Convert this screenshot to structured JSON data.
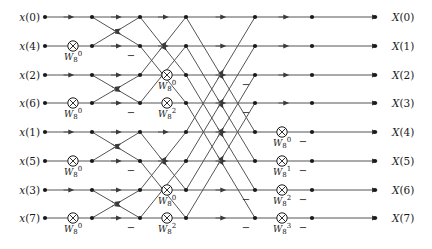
{
  "figure": {
    "kind": "fft-butterfly-signal-flow-graph",
    "size": 8,
    "stages": 3
  },
  "geometry": {
    "width": 432,
    "height": 249,
    "row_y": [
      17,
      46,
      75,
      103,
      132,
      161,
      190,
      218
    ],
    "node_x": [
      45,
      73,
      92,
      140,
      167,
      186,
      255,
      282,
      312,
      375
    ],
    "input_label_x": 40,
    "output_label_x": 392,
    "dot_radius": 2.1,
    "circle_radius": 5.2
  },
  "colors": {
    "line": "#555555",
    "ink": "#1a1a1a",
    "background": "#ffffff"
  },
  "inputs": [
    {
      "label_var": "x",
      "index": "0"
    },
    {
      "label_var": "x",
      "index": "4"
    },
    {
      "label_var": "x",
      "index": "2"
    },
    {
      "label_var": "x",
      "index": "6"
    },
    {
      "label_var": "x",
      "index": "1"
    },
    {
      "label_var": "x",
      "index": "5"
    },
    {
      "label_var": "x",
      "index": "3"
    },
    {
      "label_var": "x",
      "index": "7"
    }
  ],
  "outputs": [
    {
      "label_var": "X",
      "index": "0"
    },
    {
      "label_var": "X",
      "index": "1"
    },
    {
      "label_var": "X",
      "index": "2"
    },
    {
      "label_var": "X",
      "index": "3"
    },
    {
      "label_var": "X",
      "index": "4"
    },
    {
      "label_var": "X",
      "index": "5"
    },
    {
      "label_var": "X",
      "index": "6"
    },
    {
      "label_var": "X",
      "index": "7"
    }
  ],
  "input_text": [
    "x(0)",
    "x(4)",
    "x(2)",
    "x(6)",
    "x(1)",
    "x(5)",
    "x(3)",
    "x(7)"
  ],
  "output_text": [
    "X(0)",
    "X(1)",
    "X(2)",
    "X(3)",
    "X(4)",
    "X(5)",
    "X(6)",
    "X(7)"
  ],
  "twiddles": [
    {
      "stage": 1,
      "row": 1,
      "base": "W",
      "sub": "8",
      "sup": "0",
      "x": 73,
      "y": 46
    },
    {
      "stage": 1,
      "row": 3,
      "base": "W",
      "sub": "8",
      "sup": "0",
      "x": 73,
      "y": 103
    },
    {
      "stage": 1,
      "row": 5,
      "base": "W",
      "sub": "8",
      "sup": "0",
      "x": 73,
      "y": 161
    },
    {
      "stage": 1,
      "row": 7,
      "base": "W",
      "sub": "8",
      "sup": "0",
      "x": 73,
      "y": 218
    },
    {
      "stage": 2,
      "row": 2,
      "base": "W",
      "sub": "8",
      "sup": "0",
      "x": 158,
      "y": 75
    },
    {
      "stage": 2,
      "row": 3,
      "base": "W",
      "sub": "8",
      "sup": "2",
      "x": 158,
      "y": 103
    },
    {
      "stage": 2,
      "row": 6,
      "base": "W",
      "sub": "8",
      "sup": "0",
      "x": 158,
      "y": 190
    },
    {
      "stage": 2,
      "row": 7,
      "base": "W",
      "sub": "8",
      "sup": "2",
      "x": 158,
      "y": 218
    },
    {
      "stage": 3,
      "row": 4,
      "base": "W",
      "sub": "8",
      "sup": "0",
      "x": 271,
      "y": 132
    },
    {
      "stage": 3,
      "row": 5,
      "base": "W",
      "sub": "8",
      "sup": "1",
      "x": 271,
      "y": 161
    },
    {
      "stage": 3,
      "row": 6,
      "base": "W",
      "sub": "8",
      "sup": "2",
      "x": 271,
      "y": 190
    },
    {
      "stage": 3,
      "row": 7,
      "base": "W",
      "sub": "8",
      "sup": "3",
      "x": 271,
      "y": 218
    }
  ],
  "twiddle_text": [
    "W80",
    "W80",
    "W80",
    "W80",
    "W80",
    "W82",
    "W80",
    "W82",
    "W80",
    "W81",
    "W82",
    "W83"
  ],
  "minus_signs": [
    {
      "x": 131,
      "y": 55
    },
    {
      "x": 131,
      "y": 112
    },
    {
      "x": 131,
      "y": 170
    },
    {
      "x": 131,
      "y": 227
    },
    {
      "x": 246,
      "y": 84
    },
    {
      "x": 246,
      "y": 112
    },
    {
      "x": 246,
      "y": 199
    },
    {
      "x": 246,
      "y": 227
    },
    {
      "x": 303,
      "y": 141
    },
    {
      "x": 303,
      "y": 170
    },
    {
      "x": 303,
      "y": 199
    },
    {
      "x": 303,
      "y": 227
    }
  ],
  "minus_glyph": "−",
  "stage_pairs": {
    "stage1": [
      [
        0,
        1
      ],
      [
        2,
        3
      ],
      [
        4,
        5
      ],
      [
        6,
        7
      ]
    ],
    "stage2": [
      [
        0,
        2
      ],
      [
        1,
        3
      ],
      [
        4,
        6
      ],
      [
        5,
        7
      ]
    ],
    "stage3": [
      [
        0,
        4
      ],
      [
        1,
        5
      ],
      [
        2,
        6
      ],
      [
        3,
        7
      ]
    ]
  }
}
